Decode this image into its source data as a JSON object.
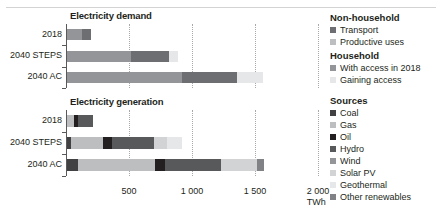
{
  "axis": {
    "ticks": [
      {
        "value": 500,
        "label": "500"
      },
      {
        "value": 1000,
        "label": "1 000"
      },
      {
        "value": 1500,
        "label": "1 500"
      },
      {
        "value": 2000,
        "label": "2 000"
      }
    ],
    "unit": "TWh",
    "max": 2000
  },
  "colors": {
    "transport": "#6d6e71",
    "productive_uses": "#bcbec0",
    "with_access_2018": "#939598",
    "gaining_access": "#e6e7e8",
    "coal": "#414042",
    "gas": "#bcbec0",
    "oil": "#231f20",
    "hydro": "#58595b",
    "wind": "#939598",
    "solar_pv": "#d1d3d4",
    "geothermal": "#e6e7e8",
    "other_renewables": "#808285"
  },
  "charts": [
    {
      "title": "Electricity demand",
      "series_keys": [
        "with_access_2018",
        "gaining_access",
        "transport",
        "productive_uses"
      ],
      "rows": [
        {
          "label": "2018",
          "segments": [
            {
              "key": "with_access_2018",
              "value": 120
            },
            {
              "key": "transport",
              "value": 70
            }
          ]
        },
        {
          "label": "2040 STEPS",
          "segments": [
            {
              "key": "with_access_2018",
              "value": 505
            },
            {
              "key": "transport",
              "value": 305
            },
            {
              "key": "gaining_access",
              "value": 70
            }
          ]
        },
        {
          "label": "2040 AC",
          "segments": [
            {
              "key": "with_access_2018",
              "value": 910
            },
            {
              "key": "transport",
              "value": 440
            },
            {
              "key": "gaining_access",
              "value": 205
            }
          ]
        }
      ]
    },
    {
      "title": "Electricity generation",
      "series_keys": [
        "coal",
        "gas",
        "oil",
        "hydro",
        "wind",
        "solar_pv",
        "geothermal",
        "other_renewables"
      ],
      "rows": [
        {
          "label": "2018",
          "segments": [
            {
              "key": "gas",
              "value": 55
            },
            {
              "key": "oil",
              "value": 30
            },
            {
              "key": "hydro",
              "value": 125
            }
          ]
        },
        {
          "label": "2040 STEPS",
          "segments": [
            {
              "key": "coal",
              "value": 35
            },
            {
              "key": "gas",
              "value": 250
            },
            {
              "key": "oil",
              "value": 70
            },
            {
              "key": "hydro",
              "value": 335
            },
            {
              "key": "solar_pv",
              "value": 100
            },
            {
              "key": "geothermal",
              "value": 120
            }
          ]
        },
        {
          "label": "2040 AC",
          "segments": [
            {
              "key": "coal",
              "value": 85
            },
            {
              "key": "gas",
              "value": 610
            },
            {
              "key": "oil",
              "value": 85
            },
            {
              "key": "hydro",
              "value": 440
            },
            {
              "key": "solar_pv",
              "value": 285
            },
            {
              "key": "other_renewables",
              "value": 60
            }
          ]
        }
      ]
    }
  ],
  "legend": {
    "groups": [
      {
        "heading": "Non-household",
        "items": [
          {
            "label": "Transport",
            "key": "transport"
          },
          {
            "label": "Productive uses",
            "key": "productive_uses"
          }
        ]
      },
      {
        "heading": "Household",
        "items": [
          {
            "label": "With access in 2018",
            "key": "with_access_2018"
          },
          {
            "label": "Gaining access",
            "key": "gaining_access"
          }
        ]
      },
      {
        "heading": "Sources",
        "items": [
          {
            "label": "Coal",
            "key": "coal"
          },
          {
            "label": "Gas",
            "key": "gas"
          },
          {
            "label": "Oil",
            "key": "oil"
          },
          {
            "label": "Hydro",
            "key": "hydro"
          },
          {
            "label": "Wind",
            "key": "wind"
          },
          {
            "label": "Solar PV",
            "key": "solar_pv"
          },
          {
            "label": "Geothermal",
            "key": "geothermal"
          },
          {
            "label": "Other renewables",
            "key": "other_renewables"
          }
        ]
      }
    ]
  },
  "chart_data": {
    "type": "bar",
    "orientation": "horizontal",
    "stacked": true,
    "xlabel": "TWh",
    "ylabel": "",
    "xlim": [
      0,
      2000
    ],
    "xticks": [
      500,
      1000,
      1500,
      2000
    ],
    "grid": true,
    "legend_position": "right",
    "panels": [
      {
        "title": "Electricity demand",
        "categories": [
          "2018",
          "2040 STEPS",
          "2040 AC"
        ],
        "series": [
          {
            "name": "With access in 2018",
            "values": [
              120,
              505,
              910
            ]
          },
          {
            "name": "Transport",
            "values": [
              70,
              305,
              440
            ]
          },
          {
            "name": "Gaining access",
            "values": [
              0,
              70,
              205
            ]
          },
          {
            "name": "Productive uses",
            "values": [
              0,
              0,
              0
            ]
          }
        ],
        "totals": [
          190,
          880,
          1555
        ]
      },
      {
        "title": "Electricity generation",
        "categories": [
          "2018",
          "2040 STEPS",
          "2040 AC"
        ],
        "series": [
          {
            "name": "Coal",
            "values": [
              0,
              35,
              85
            ]
          },
          {
            "name": "Gas",
            "values": [
              55,
              250,
              610
            ]
          },
          {
            "name": "Oil",
            "values": [
              30,
              70,
              85
            ]
          },
          {
            "name": "Hydro",
            "values": [
              125,
              335,
              440
            ]
          },
          {
            "name": "Wind",
            "values": [
              0,
              0,
              0
            ]
          },
          {
            "name": "Solar PV",
            "values": [
              0,
              100,
              285
            ]
          },
          {
            "name": "Geothermal",
            "values": [
              0,
              120,
              0
            ]
          },
          {
            "name": "Other renewables",
            "values": [
              0,
              0,
              60
            ]
          }
        ],
        "totals": [
          210,
          910,
          1565
        ]
      }
    ]
  }
}
